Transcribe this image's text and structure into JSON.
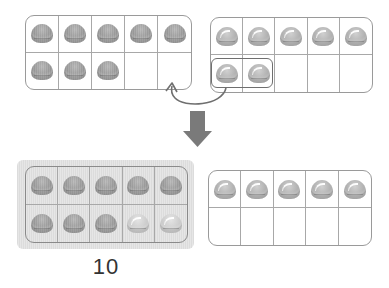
{
  "colors": {
    "frame_border": "#9a9a9a",
    "counter": "#9a9a9a",
    "counter_light": "#cdcdcd",
    "arrow": "#7a7a7a",
    "shade": "#e0e0e0",
    "label": "#333333"
  },
  "top_left_frame": {
    "filled": 8,
    "capacity": 10
  },
  "top_right_frame": {
    "filled": 7,
    "capacity": 10,
    "moved": 2
  },
  "bottom_left_frame": {
    "filled": 10,
    "capacity": 10,
    "moved_in": 2,
    "highlighted": true
  },
  "bottom_right_frame": {
    "filled": 5,
    "capacity": 10
  },
  "icons": {
    "move_arrow": "curved-arrow-icon",
    "result_arrow": "down-arrow-icon"
  },
  "result_label": "10"
}
